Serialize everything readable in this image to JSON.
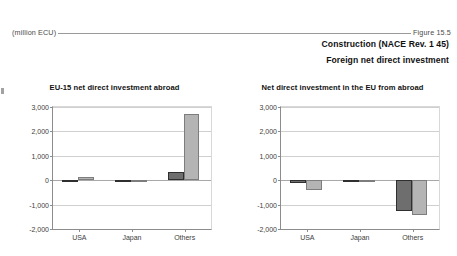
{
  "header": {
    "unit_label": "(million ECU)",
    "figure_label": "Figure 15.5",
    "title_line_1": "Construction (NACE Rev. 1 45)",
    "title_line_2": "Foreign net direct investment"
  },
  "colors": {
    "series_1": "#6e6e6e",
    "series_2": "#b4b4b4",
    "axis": "#8c8c8c",
    "grid": "#cfcfcf"
  },
  "chart_data": [
    {
      "type": "bar",
      "title": "EU-15 net direct investment abroad",
      "xlabel": "",
      "ylabel": "",
      "unit": "million ECU",
      "categories": [
        "USA",
        "Japan",
        "Others"
      ],
      "ylim": [
        -2000,
        3000
      ],
      "yticks": [
        3000,
        2000,
        1000,
        0,
        -1000,
        -2000
      ],
      "ytick_labels": [
        "3,000",
        "2,000",
        "1,000",
        "0",
        "-1,000",
        "-2,000"
      ],
      "grid": true,
      "legend": false,
      "series": [
        {
          "name": "series-1",
          "values": [
            -45,
            -70,
            350
          ]
        },
        {
          "name": "series-2",
          "values": [
            115,
            20,
            2700
          ]
        }
      ]
    },
    {
      "type": "bar",
      "title": "Net direct investment in the EU from abroad",
      "xlabel": "",
      "ylabel": "",
      "unit": "million ECU",
      "categories": [
        "USA",
        "Japan",
        "Others"
      ],
      "ylim": [
        -2000,
        3000
      ],
      "yticks": [
        3000,
        2000,
        1000,
        0,
        -1000,
        -2000
      ],
      "ytick_labels": [
        "3,000",
        "2,000",
        "1,000",
        "0",
        "-1,000",
        "-2,000"
      ],
      "grid": true,
      "legend": false,
      "series": [
        {
          "name": "series-1",
          "values": [
            -110,
            -70,
            -1250
          ]
        },
        {
          "name": "series-2",
          "values": [
            -420,
            -30,
            -1420
          ]
        }
      ]
    }
  ]
}
